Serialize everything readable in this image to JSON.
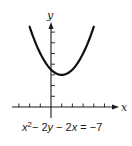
{
  "chart_data": {
    "type": "line",
    "title": "",
    "caption": "x² − 2y − 2x = −7",
    "equation": "x^2 - 2y - 2x = -7",
    "xlabel": "x",
    "ylabel": "y",
    "xlim": [
      -4,
      6
    ],
    "ylim": [
      0,
      8
    ],
    "x_ticks": [
      -3,
      -2,
      -1,
      1,
      2,
      3,
      4,
      5
    ],
    "y_ticks": [
      1,
      2,
      3,
      4,
      5,
      6,
      7
    ],
    "grid": false,
    "legend": null,
    "series": [
      {
        "name": "parabola",
        "vertex": [
          1,
          3
        ],
        "x": [
          -2,
          -1.5,
          -1,
          -0.5,
          0,
          0.5,
          1,
          1.5,
          2,
          2.5,
          3,
          3.5,
          4
        ],
        "y": [
          7.5,
          6.625,
          5,
          4.625,
          3.5,
          3.125,
          3,
          3.125,
          3.5,
          4.125,
          5,
          6.125,
          7.5
        ]
      }
    ]
  },
  "labels": {
    "x_axis": "x",
    "y_axis": "y",
    "caption_parts": [
      "x",
      "2",
      "− 2",
      "y",
      " − 2",
      "x",
      " = −7"
    ]
  }
}
